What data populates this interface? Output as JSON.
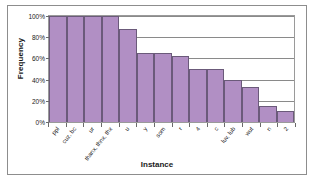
{
  "chart_data": {
    "type": "bar",
    "title": "",
    "xlabel": "Instance",
    "ylabel": "Frequency",
    "categories": [
      "ppl",
      "cuz, bc",
      "ur",
      "thanx, thnx, thx",
      "u",
      "y",
      "som",
      "r",
      "4",
      "c",
      "luv, lub",
      "wut",
      "n",
      "2"
    ],
    "values": [
      100,
      100,
      100,
      100,
      88,
      65,
      65,
      62,
      50,
      50,
      40,
      33,
      15,
      10
    ],
    "value_labels": [
      "100%",
      "100%",
      "100%",
      "100%",
      "88%",
      "65%",
      "65%",
      "62%",
      "50%",
      "50%",
      "40%",
      "33%",
      "15%",
      "10%"
    ],
    "ylim": [
      0,
      100
    ],
    "yticks": [
      0,
      20,
      40,
      60,
      80,
      100
    ],
    "ytick_labels": [
      "0%",
      "20%",
      "40%",
      "60%",
      "80%",
      "100%"
    ],
    "grid": true,
    "legend": false,
    "bar_color": "#b18fc4",
    "bar_border_color": "#6b5a7a",
    "plot_border_color": "#9a9a9a",
    "figure_border_color": "#8d8d8d",
    "background": "#ffffff"
  }
}
